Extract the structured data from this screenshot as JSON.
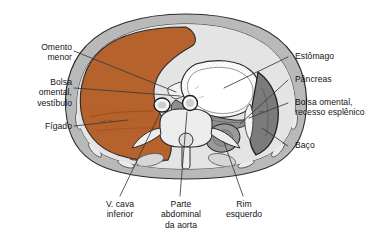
{
  "figure": {
    "kind": "anatomical-cross-section",
    "colors": {
      "liver": "#b5622c",
      "liver_shade": "#a9571f",
      "body_wall": "#b9b9b9",
      "body_wall_inner": "#d9d9d9",
      "fat_light": "#e2e2e2",
      "spleen": "#7b7b7b",
      "pancreas": "#8e8e8e",
      "kidney": "#9a9a9a",
      "stomach_lumen": "#ffffff",
      "bone": "#ededed",
      "outline": "#2b2b2b",
      "leader_line": "#3a3a3a",
      "label_text": "#141414",
      "background": "#ffffff"
    }
  },
  "labels": {
    "left": [
      {
        "id": "omento-menor",
        "text": "Omento\nmenor"
      },
      {
        "id": "bolsa-omental-vestibulo",
        "text": "Bolsa\nomental,\nvestíbulo"
      },
      {
        "id": "figado",
        "text": "Fígado"
      }
    ],
    "right": [
      {
        "id": "estomago",
        "text": "Estômago"
      },
      {
        "id": "pancreas",
        "text": "Pâncreas"
      },
      {
        "id": "bolsa-omental-recesso-esplenico",
        "text": "Bolsa omental,\nrecesso esplênico"
      },
      {
        "id": "baco",
        "text": "Baço"
      }
    ],
    "bottom": [
      {
        "id": "veia-cava-inferior",
        "text": "V. cava\ninferior"
      },
      {
        "id": "parte-abdominal-da-aorta",
        "text": "Parte\nabdominal\nda aorta"
      },
      {
        "id": "rim-esquerdo",
        "text": "Rim\nesquerdo"
      }
    ]
  },
  "structures": [
    {
      "id": "figado",
      "name": "Fígado"
    },
    {
      "id": "estomago",
      "name": "Estômago"
    },
    {
      "id": "pancreas",
      "name": "Pâncreas"
    },
    {
      "id": "baco",
      "name": "Baço"
    },
    {
      "id": "rim-esquerdo",
      "name": "Rim esquerdo"
    },
    {
      "id": "aorta",
      "name": "Parte abdominal da aorta"
    },
    {
      "id": "veia-cava-inferior",
      "name": "V. cava inferior"
    },
    {
      "id": "vertebra",
      "name": "Vértebra"
    },
    {
      "id": "parede-corporal",
      "name": "Parede corporal"
    },
    {
      "id": "bolsa-omental-vestibulo",
      "name": "Bolsa omental, vestíbulo"
    },
    {
      "id": "bolsa-omental-recesso-esplenico",
      "name": "Bolsa omental, recesso esplênico"
    },
    {
      "id": "omento-menor",
      "name": "Omento menor"
    }
  ]
}
